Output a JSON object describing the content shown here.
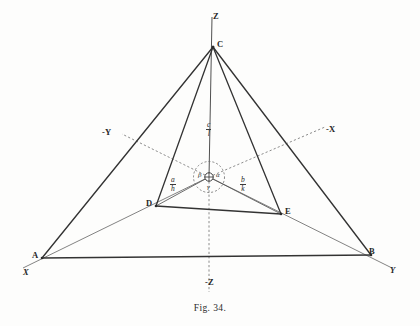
{
  "figure": {
    "caption": "Fig. 34."
  },
  "axes": {
    "z_positive": "Z",
    "z_negative": "-Z",
    "x_positive": "X",
    "x_negative": "-X",
    "y_positive": "Y",
    "y_negative": "-Y"
  },
  "vertices": {
    "a": "A",
    "b": "B",
    "c": "C",
    "d": "D",
    "e": "E"
  },
  "angles": {
    "alpha": "α",
    "beta": "β",
    "gamma": "γ"
  },
  "fractions": {
    "vertical": {
      "numerator": "c",
      "denominator": "l"
    },
    "left": {
      "numerator": "a",
      "denominator": "h"
    },
    "right": {
      "numerator": "b",
      "denominator": "k"
    }
  },
  "colors": {
    "ink": "#2b2b2b",
    "solid_line": "#3a3a3a",
    "thin_line": "#5a5a5a",
    "dashed_line": "#6e6e6e",
    "paper": "#fdfdfc"
  },
  "geometry": {
    "origin": {
      "x": 209,
      "y": 177
    },
    "points": {
      "A": {
        "x": 42,
        "y": 258
      },
      "B": {
        "x": 371,
        "y": 255
      },
      "C": {
        "x": 213,
        "y": 47
      },
      "D": {
        "x": 156,
        "y": 206
      },
      "E": {
        "x": 281,
        "y": 214
      }
    }
  }
}
